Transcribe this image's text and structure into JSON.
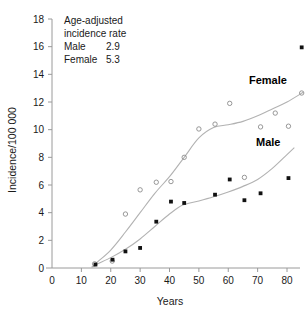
{
  "chart_data": {
    "type": "scatter",
    "title": "",
    "xlabel": "Years",
    "ylabel": "Incidence/100 000",
    "xlim": [
      0,
      88
    ],
    "ylim": [
      0,
      18
    ],
    "xticks": [
      0,
      10,
      20,
      30,
      40,
      50,
      60,
      70,
      80
    ],
    "yticks": [
      0,
      2,
      4,
      6,
      8,
      10,
      12,
      14,
      16,
      18
    ],
    "grid": false,
    "legend_position": "inline-right",
    "annotation": {
      "line1": "Age-adjusted",
      "line2": "incidence rate",
      "male_label": "Male",
      "male_value": "2.9",
      "female_label": "Female",
      "female_value": "5.3"
    },
    "series": [
      {
        "name": "Female",
        "label": "Female",
        "marker": "open-circle",
        "color": "#8c8c8c",
        "points": [
          [
            14.5,
            0.3
          ],
          [
            20.5,
            0.5
          ],
          [
            25.0,
            3.9
          ],
          [
            30.0,
            5.65
          ],
          [
            35.5,
            6.2
          ],
          [
            40.5,
            6.25
          ],
          [
            45.0,
            8.0
          ],
          [
            50.0,
            10.05
          ],
          [
            55.5,
            10.4
          ],
          [
            60.5,
            11.9
          ],
          [
            65.5,
            6.55
          ],
          [
            71.0,
            10.2
          ],
          [
            76.0,
            11.2
          ],
          [
            80.5,
            10.25
          ],
          [
            85.0,
            12.65
          ]
        ],
        "trend": [
          [
            13.5,
            0.05
          ],
          [
            15.0,
            0.35
          ],
          [
            20.0,
            1.3
          ],
          [
            25.0,
            2.6
          ],
          [
            30.0,
            4.0
          ],
          [
            35.0,
            5.4
          ],
          [
            40.0,
            6.6
          ],
          [
            45.0,
            8.0
          ],
          [
            50.0,
            9.4
          ],
          [
            55.0,
            10.15
          ],
          [
            60.0,
            10.35
          ],
          [
            65.0,
            10.6
          ],
          [
            70.0,
            11.0
          ],
          [
            75.0,
            11.5
          ],
          [
            80.0,
            12.0
          ],
          [
            85.5,
            12.7
          ]
        ]
      },
      {
        "name": "Male",
        "label": "Male",
        "marker": "filled-square",
        "color": "#111111",
        "points": [
          [
            14.8,
            0.25
          ],
          [
            20.6,
            0.6
          ],
          [
            25.0,
            1.2
          ],
          [
            30.0,
            1.45
          ],
          [
            35.5,
            3.35
          ],
          [
            40.5,
            4.8
          ],
          [
            45.0,
            4.7
          ],
          [
            55.5,
            5.3
          ],
          [
            60.5,
            6.4
          ],
          [
            65.5,
            4.9
          ],
          [
            71.0,
            5.4
          ],
          [
            80.5,
            6.5
          ],
          [
            85.0,
            15.95
          ]
        ],
        "trend": [
          [
            13.8,
            0.05
          ],
          [
            15.0,
            0.25
          ],
          [
            20.0,
            0.75
          ],
          [
            25.0,
            1.35
          ],
          [
            30.0,
            2.1
          ],
          [
            35.0,
            3.0
          ],
          [
            40.0,
            3.9
          ],
          [
            44.5,
            4.55
          ],
          [
            50.0,
            4.85
          ],
          [
            55.0,
            5.15
          ],
          [
            60.0,
            5.5
          ],
          [
            65.0,
            5.9
          ],
          [
            70.0,
            6.4
          ],
          [
            75.0,
            7.2
          ],
          [
            80.0,
            8.2
          ],
          [
            82.5,
            8.7
          ]
        ]
      }
    ]
  }
}
